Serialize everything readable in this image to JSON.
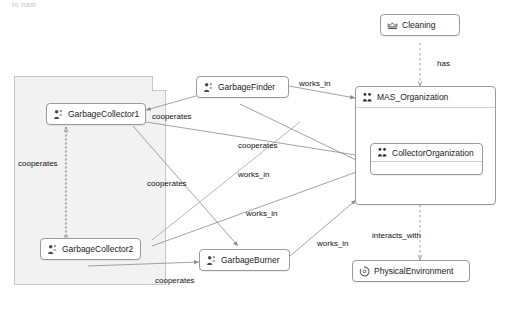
{
  "diagram": {
    "title_artifact": "to nam",
    "group": {
      "name": "collector-group-box"
    },
    "nodes": [
      {
        "id": "garbage_collector_1",
        "label": "GarbageCollector1",
        "icon": "agent-icon"
      },
      {
        "id": "garbage_collector_2",
        "label": "GarbageCollector2",
        "icon": "agent-icon"
      },
      {
        "id": "garbage_finder",
        "label": "GarbageFinder",
        "icon": "agent-icon"
      },
      {
        "id": "garbage_burner",
        "label": "GarbageBurner",
        "icon": "agent-icon"
      },
      {
        "id": "cleaning",
        "label": "Cleaning",
        "icon": "goal-icon"
      },
      {
        "id": "mas_organization",
        "label": "MAS_Organization",
        "icon": "organization-icon"
      },
      {
        "id": "collector_organization",
        "label": "CollectorOrganization",
        "icon": "organization-icon"
      },
      {
        "id": "physical_environment",
        "label": "PhysicalEnvironment",
        "icon": "environment-icon"
      }
    ],
    "edge_labels": [
      {
        "id": "cooperates_gf_gc1",
        "text": "cooperates"
      },
      {
        "id": "cooperates_left",
        "text": "cooperates"
      },
      {
        "id": "cooperates_mid",
        "text": "cooperates"
      },
      {
        "id": "cooperates_center",
        "text": "cooperates"
      },
      {
        "id": "cooperates_bottom",
        "text": "cooperates"
      },
      {
        "id": "works_in_finder",
        "text": "works_in"
      },
      {
        "id": "works_in_gc1",
        "text": "works_in"
      },
      {
        "id": "works_in_gc2",
        "text": "works_in"
      },
      {
        "id": "works_in_burner",
        "text": "works_in"
      },
      {
        "id": "has",
        "text": "has"
      },
      {
        "id": "interacts_with",
        "text": "interacts_with"
      }
    ],
    "colors": {
      "background": "#ffffff",
      "node_border": "#9a9a9a",
      "group_fill": "#f2f2f2",
      "group_border": "#c8c8c8",
      "edge": "#8c8c8c",
      "text": "#1a1a1a"
    }
  }
}
